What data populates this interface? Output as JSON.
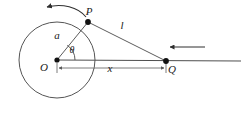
{
  "diagram": {
    "background_color": "#ffffff",
    "stroke_color": "#4a4a4a",
    "label_color": "#1a1a1a",
    "geometry": {
      "circle": {
        "cx": 57,
        "cy": 60,
        "r": 38
      },
      "points": {
        "O": {
          "x": 57,
          "y": 60,
          "label": "O",
          "label_x": 44,
          "label_y": 71
        },
        "P": {
          "x": 88,
          "y": 22,
          "label": "P",
          "label_x": 86,
          "label_y": 15
        },
        "Q": {
          "x": 166,
          "y": 61,
          "label": "Q",
          "label_x": 169,
          "label_y": 73
        }
      },
      "segments": {
        "radius_OP": {
          "label": "a",
          "label_x": 55,
          "label_y": 38
        },
        "cord_PQ": {
          "label": "l",
          "label_x": 120,
          "label_y": 29
        },
        "distance_OQ": {
          "label": "x",
          "label_x": 106,
          "label_y": 71
        }
      },
      "angle": {
        "label": "θ",
        "label_x": 68,
        "label_y": 52,
        "vertex": "O"
      }
    },
    "annotations": {
      "rotation_arrow": {
        "name": "counterclockwise rotation of P about O",
        "direction": "counterclockwise"
      },
      "velocity_arrow": {
        "name": "leftward motion of Q along horizontal line",
        "direction": "left"
      },
      "horizontal_line": {
        "name": "horizontal axis through O and Q extending right"
      }
    }
  }
}
